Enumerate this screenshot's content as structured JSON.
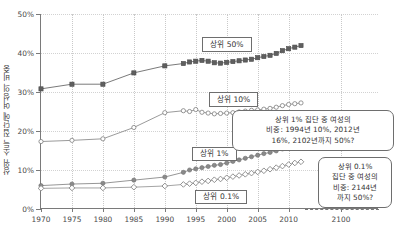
{
  "chart_data": {
    "type": "line",
    "title": "",
    "xlabel": "",
    "ylabel": "상위 소득 집단에 여성의 비중",
    "ylim": [
      0,
      50
    ],
    "xlim": [
      1970,
      2100
    ],
    "ytick_labels": [
      "0%",
      "10%",
      "20%",
      "30%",
      "40%",
      "50%"
    ],
    "ytick_values": [
      0,
      10,
      20,
      30,
      40,
      50
    ],
    "xtick_labels": [
      "1970",
      "1975",
      "1980",
      "1985",
      "1990",
      "1995",
      "2000",
      "2005",
      "2010",
      "2100"
    ],
    "xtick_values": [
      1970,
      1975,
      1980,
      1985,
      1990,
      1995,
      2000,
      2005,
      2010,
      2100
    ],
    "grid": true,
    "legend_position": "inline-callouts",
    "series": [
      {
        "name": "상위 50%",
        "marker": "filled-square",
        "color": "#6b6b6b",
        "x": [
          1970,
          1975,
          1980,
          1985,
          1990,
          1993,
          1994,
          1995,
          1996,
          1997,
          1998,
          1999,
          2000,
          2001,
          2002,
          2003,
          2004,
          2005,
          2006,
          2007,
          2008,
          2009,
          2010,
          2011,
          2012
        ],
        "values": [
          30.8,
          32.0,
          32.0,
          34.9,
          36.7,
          37.3,
          37.7,
          37.9,
          38.1,
          37.9,
          37.5,
          37.4,
          37.6,
          37.8,
          38.0,
          38.2,
          38.4,
          38.8,
          39.1,
          39.4,
          39.9,
          40.6,
          41.1,
          41.5,
          41.9
        ]
      },
      {
        "name": "상위 10%",
        "marker": "hollow-circle",
        "color": "#8e8e8e",
        "x": [
          1970,
          1975,
          1980,
          1985,
          1990,
          1993,
          1994,
          1995,
          1996,
          1997,
          1998,
          1999,
          2000,
          2001,
          2002,
          2003,
          2004,
          2005,
          2006,
          2007,
          2008,
          2009,
          2010,
          2011,
          2012
        ],
        "values": [
          17.3,
          17.6,
          18.0,
          20.9,
          24.7,
          25.2,
          25.0,
          25.5,
          24.8,
          24.6,
          24.4,
          24.5,
          24.6,
          24.7,
          24.9,
          25.1,
          25.3,
          25.4,
          25.6,
          25.8,
          26.1,
          26.5,
          26.8,
          27.0,
          27.2
        ]
      },
      {
        "name": "상위 1%",
        "marker": "filled-circle",
        "color": "#8a8a8a",
        "x": [
          1970,
          1975,
          1980,
          1985,
          1990,
          1993,
          1994,
          1995,
          1996,
          1997,
          1998,
          1999,
          2000,
          2001,
          2002,
          2003,
          2004,
          2005,
          2006,
          2007,
          2008,
          2009,
          2010,
          2011,
          2012
        ],
        "values": [
          6.0,
          6.4,
          6.6,
          7.4,
          8.2,
          9.4,
          10.0,
          10.3,
          10.6,
          10.9,
          11.2,
          11.4,
          11.8,
          12.2,
          12.6,
          13.0,
          13.4,
          13.8,
          14.2,
          14.5,
          14.9,
          15.4,
          15.9,
          16.3,
          16.7
        ]
      },
      {
        "name": "상위 0.1%",
        "marker": "hollow-diamond",
        "color": "#9a9a9a",
        "x": [
          1970,
          1975,
          1980,
          1985,
          1990,
          1993,
          1994,
          1995,
          1996,
          1997,
          1998,
          1999,
          2000,
          2001,
          2002,
          2003,
          2004,
          2005,
          2006,
          2007,
          2008,
          2009,
          2010,
          2011,
          2012
        ],
        "values": [
          5.3,
          5.4,
          5.4,
          5.6,
          5.9,
          6.3,
          6.5,
          6.7,
          7.0,
          7.2,
          7.5,
          7.7,
          8.0,
          8.3,
          8.6,
          8.9,
          9.2,
          9.5,
          9.8,
          10.2,
          10.6,
          11.0,
          11.4,
          11.8,
          12.1
        ]
      }
    ],
    "series_callouts": [
      {
        "label": "상위 50%",
        "x_pct": 48.0,
        "y_pct": 12.0
      },
      {
        "label": "상위 10%",
        "x_pct": 50.0,
        "y_pct": 40.0
      },
      {
        "label": "상위 1%",
        "x_pct": 45.0,
        "y_pct": 68.0
      },
      {
        "label": "상위 0.1%",
        "x_pct": 46.0,
        "y_pct": 90.0
      }
    ],
    "annotations": [
      {
        "id": "note-top-1pct",
        "lines": [
          "상위 1% 집단 중 여성의",
          "비중: 1994년 10%, 2012년",
          "16%, 2102년까지 50%?"
        ]
      },
      {
        "id": "note-bottom-01pct",
        "lines": [
          "상위 0.1%",
          "집단 중 여성의",
          "비중: 2144년",
          "까지 50%?"
        ]
      }
    ]
  }
}
